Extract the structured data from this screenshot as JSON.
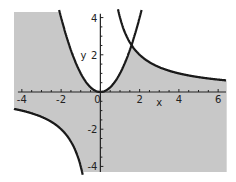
{
  "chart_data": {
    "type": "area",
    "title": "",
    "xlabel": "x",
    "ylabel": "y",
    "xlim": [
      -4.4,
      6.4
    ],
    "ylim": [
      -4.3,
      4.3
    ],
    "x_ticks": [
      -4,
      -2,
      0,
      2,
      4,
      6
    ],
    "y_ticks": [
      -4,
      -2,
      2,
      4
    ],
    "x_tick_labels": [
      "-4",
      "-2",
      "0",
      "2",
      "4",
      "6"
    ],
    "y_tick_labels": [
      "-4",
      "-2",
      "2",
      "4"
    ],
    "grid": false,
    "legend": [],
    "series": [
      {
        "name": "y = x^2",
        "kind": "curve",
        "color": "#1a1a1a"
      },
      {
        "name": "y = 4/x",
        "kind": "curve",
        "color": "#1a1a1a"
      }
    ],
    "shaded_region": {
      "description": "y < x^2 and x*y < 4",
      "color": "#c8c8c8"
    },
    "intersection": {
      "x": 1.59,
      "y": 2.52
    }
  },
  "labels": {
    "x_axis": "x",
    "y_axis": "y",
    "origin": "0"
  }
}
